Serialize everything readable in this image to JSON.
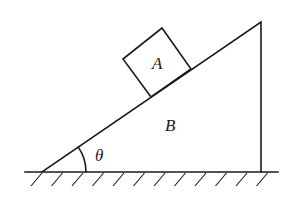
{
  "diagram": {
    "labels": {
      "block": "A",
      "wedge": "B",
      "angle": "θ"
    },
    "elements": [
      "ground with hatching",
      "wedge B (right triangle)",
      "block A (square on incline)",
      "angle arc θ"
    ],
    "colors": {
      "stroke": "#1a1a1a",
      "background": "#ffffff"
    }
  }
}
